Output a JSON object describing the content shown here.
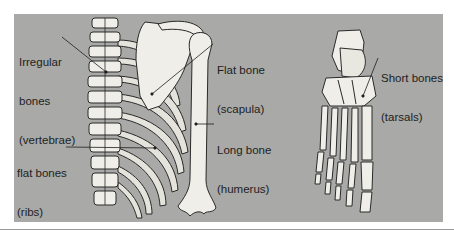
{
  "diagram": {
    "colors": {
      "background": "#ffffff",
      "panel": "#a9a9a7",
      "bone_fill": "#efeee8",
      "bone_outline": "#2a2a2a",
      "label_text": "#1e1e1e",
      "leader_line": "#1e1e1e"
    },
    "labels": [
      {
        "id": "irregular",
        "line1": "Irregular",
        "line2": "bones",
        "line3": "(vertebrae)"
      },
      {
        "id": "flat-scapula",
        "line1": "Flat bone",
        "line2": "(scapula)"
      },
      {
        "id": "long",
        "line1": "Long bone",
        "line2": "(humerus)"
      },
      {
        "id": "flat-ribs",
        "line1": "flat bones",
        "line2": "(ribs)"
      },
      {
        "id": "short",
        "line1": "Short bones",
        "line2": "(tarsals)"
      }
    ],
    "figures": [
      {
        "name": "Thoracic skeleton with spine, ribs, scapula and humerus"
      },
      {
        "name": "Foot skeleton (tarsals, metatarsals, phalanges)"
      }
    ]
  }
}
